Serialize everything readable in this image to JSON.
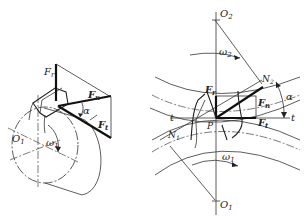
{
  "figure": {
    "left_view": {
      "title": "3D tooth force view",
      "labels": {
        "Fr": "F",
        "Fr_sub": "r",
        "Fn": "F",
        "Fn_sub": "n",
        "Ft": "F",
        "Ft_sub": "t",
        "alpha": "α",
        "omega": "ω",
        "omega_sub": "1",
        "O": "O",
        "O_sub": "1"
      }
    },
    "right_view": {
      "title": "Meshing gears force diagram",
      "labels": {
        "O2": "O",
        "O2_sub": "2",
        "O1": "O",
        "O1_sub": "1",
        "omega2": "ω",
        "omega2_sub": "2",
        "omega1": "ω",
        "omega1_sub": "1",
        "N2": "N",
        "N2_sub": "2",
        "N1": "N",
        "N1_sub": "1",
        "Fr": "F",
        "Fr_sub": "r",
        "Fn": "F",
        "Fn_sub": "n",
        "Ft": "F",
        "Ft_sub": "t",
        "alpha": "α",
        "t_left": "t",
        "t_right": "t",
        "P": "P"
      }
    }
  }
}
